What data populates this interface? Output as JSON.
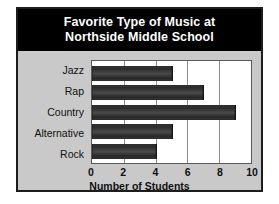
{
  "figure": {
    "title_line_1": "Favorite Type of Music at",
    "title_line_2": "Northside Middle School",
    "banner_color": "#000000",
    "banner_text_color": "#ffffff",
    "panel_background": "#c9c9c9",
    "plot_background": "#ffffff",
    "bar_color": "#333333",
    "gridline_color": "#8c8c8c"
  },
  "chart_data": {
    "type": "bar",
    "orientation": "horizontal",
    "title": "Favorite Type of Music at Northside Middle School",
    "categories": [
      "Jazz",
      "Rap",
      "Country",
      "Alternative",
      "Rock"
    ],
    "values": [
      5,
      7,
      9,
      5,
      4
    ],
    "xlabel": "Number of Students",
    "ylabel": "",
    "xlim": [
      0,
      10
    ],
    "xticks": [
      0,
      2,
      4,
      6,
      8,
      10
    ],
    "xtick_labels": [
      "0",
      "2",
      "4",
      "6",
      "8",
      "10"
    ],
    "grid": true,
    "grid_axis": "x",
    "legend": false
  }
}
